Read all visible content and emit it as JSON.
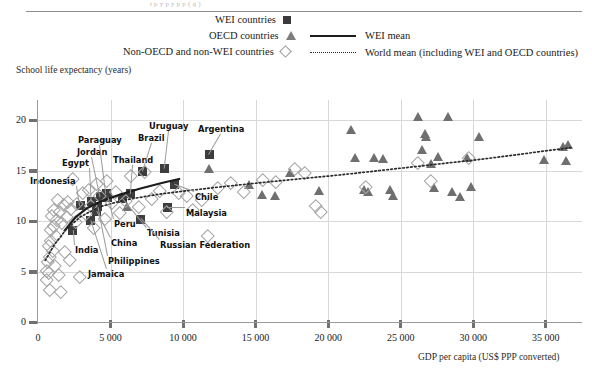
{
  "figure": {
    "clipped_title": "t p   y  p        y  p      p        ( q       )",
    "y_axis_title": "School life expectancy (years)",
    "x_axis_title": "GDP per capita (US$ PPP converted)"
  },
  "legend": {
    "items": [
      {
        "label": "WEI  countries",
        "marker": "filled-square",
        "color": "#3b3b3b"
      },
      {
        "label": "OECD countries",
        "marker": "filled-triangle",
        "color": "#7d7d7d"
      },
      {
        "label": "Non-OECD and  non-WEI countries",
        "marker": "open-diamond",
        "color": "#999999"
      }
    ],
    "lines": [
      {
        "label": "WEI mean",
        "style": "solid",
        "color": "#1d1d1d"
      },
      {
        "label": "World mean (including WEI and OECD countries)",
        "style": "dotted",
        "color": "#2a2a2a"
      }
    ]
  },
  "chart_data": {
    "type": "scatter",
    "title": "",
    "xlabel": "GDP per capita (US$ PPP converted)",
    "ylabel": "School life expectancy (years)",
    "xlim": [
      0,
      37500
    ],
    "ylim": [
      0,
      22
    ],
    "xticks": [
      0,
      5000,
      10000,
      15000,
      20000,
      25000,
      30000,
      35000
    ],
    "xticklabels": [
      "0",
      "5 000",
      "10 000",
      "15 000",
      "20 000",
      "25 000",
      "30 000",
      "35 000"
    ],
    "yticks": [
      0,
      5,
      10,
      15,
      20
    ],
    "yticklabels": [
      "0",
      "5",
      "10",
      "15",
      "20"
    ],
    "grid": true,
    "legend_position": "top",
    "series": [
      {
        "name": "WEI countries",
        "marker": "filled-square",
        "color": "#3d3d3d",
        "points": [
          {
            "label": "India",
            "x": 2400,
            "y": 9.1
          },
          {
            "label": "Jamaica",
            "x": 3600,
            "y": 10.1
          },
          {
            "label": "Indonesia",
            "x": 2900,
            "y": 11.5
          },
          {
            "label": "Egypt",
            "x": 3700,
            "y": 11.9
          },
          {
            "label": "China",
            "x": 4000,
            "y": 11.0
          },
          {
            "label": "Philippines",
            "x": 4100,
            "y": 11.4
          },
          {
            "label": "Jordan",
            "x": 4300,
            "y": 12.4
          },
          {
            "label": "Paraguay",
            "x": 4700,
            "y": 12.7
          },
          {
            "label": "Peru",
            "x": 4800,
            "y": 12.3
          },
          {
            "label": "Tunisia",
            "x": 5800,
            "y": 12.2
          },
          {
            "label": "Thailand",
            "x": 6400,
            "y": 12.7
          },
          {
            "label": "Russian Federation",
            "x": 7100,
            "y": 10.2
          },
          {
            "label": "Brazil",
            "x": 7200,
            "y": 14.9
          },
          {
            "label": "Uruguay",
            "x": 8700,
            "y": 15.2
          },
          {
            "label": "Malaysia",
            "x": 8900,
            "y": 11.3
          },
          {
            "label": "Chile",
            "x": 9400,
            "y": 13.6
          },
          {
            "label": "Argentina",
            "x": 11800,
            "y": 16.6
          }
        ]
      },
      {
        "name": "OECD countries",
        "marker": "filled-triangle",
        "color": "#6f6f6f",
        "points": [
          {
            "x": 6200,
            "y": 11.4
          },
          {
            "x": 11800,
            "y": 15.2
          },
          {
            "x": 14600,
            "y": 13.6
          },
          {
            "x": 15500,
            "y": 12.6
          },
          {
            "x": 16400,
            "y": 12.5
          },
          {
            "x": 17400,
            "y": 14.8
          },
          {
            "x": 19400,
            "y": 13.0
          },
          {
            "x": 21600,
            "y": 19.0
          },
          {
            "x": 21900,
            "y": 16.3
          },
          {
            "x": 22500,
            "y": 13.1
          },
          {
            "x": 22800,
            "y": 12.9
          },
          {
            "x": 23200,
            "y": 16.3
          },
          {
            "x": 23800,
            "y": 16.2
          },
          {
            "x": 24300,
            "y": 13.1
          },
          {
            "x": 24500,
            "y": 12.5
          },
          {
            "x": 26200,
            "y": 20.3
          },
          {
            "x": 26500,
            "y": 17.0
          },
          {
            "x": 26700,
            "y": 18.6
          },
          {
            "x": 26800,
            "y": 18.3
          },
          {
            "x": 27100,
            "y": 15.7
          },
          {
            "x": 27300,
            "y": 13.3
          },
          {
            "x": 27600,
            "y": 16.4
          },
          {
            "x": 28300,
            "y": 20.3
          },
          {
            "x": 28600,
            "y": 12.9
          },
          {
            "x": 29100,
            "y": 12.4
          },
          {
            "x": 29600,
            "y": 16.3
          },
          {
            "x": 29900,
            "y": 13.4
          },
          {
            "x": 30400,
            "y": 18.3
          },
          {
            "x": 34900,
            "y": 16.1
          },
          {
            "x": 36200,
            "y": 17.3
          },
          {
            "x": 36400,
            "y": 16.0
          },
          {
            "x": 36600,
            "y": 17.5
          }
        ]
      },
      {
        "name": "Non-OECD and non-WEI countries",
        "marker": "open-diamond",
        "color": "#a5a5a5",
        "points": [
          {
            "x": 500,
            "y": 5.2
          },
          {
            "x": 550,
            "y": 4.3
          },
          {
            "x": 600,
            "y": 6.1
          },
          {
            "x": 650,
            "y": 5.0
          },
          {
            "x": 700,
            "y": 7.7
          },
          {
            "x": 720,
            "y": 6.6
          },
          {
            "x": 760,
            "y": 3.3
          },
          {
            "x": 800,
            "y": 9.2
          },
          {
            "x": 820,
            "y": 8.2
          },
          {
            "x": 900,
            "y": 10.6
          },
          {
            "x": 950,
            "y": 7.2
          },
          {
            "x": 1000,
            "y": 9.6
          },
          {
            "x": 1050,
            "y": 11.2
          },
          {
            "x": 1100,
            "y": 5.7
          },
          {
            "x": 1150,
            "y": 8.6
          },
          {
            "x": 1250,
            "y": 10.2
          },
          {
            "x": 1300,
            "y": 12.2
          },
          {
            "x": 1350,
            "y": 4.8
          },
          {
            "x": 1400,
            "y": 11.0
          },
          {
            "x": 1500,
            "y": 3.1
          },
          {
            "x": 1600,
            "y": 9.9
          },
          {
            "x": 1700,
            "y": 11.7
          },
          {
            "x": 1800,
            "y": 7.1
          },
          {
            "x": 1900,
            "y": 10.5
          },
          {
            "x": 2000,
            "y": 12.0
          },
          {
            "x": 2100,
            "y": 6.3
          },
          {
            "x": 2200,
            "y": 11.3
          },
          {
            "x": 2300,
            "y": 14.3
          },
          {
            "x": 2500,
            "y": 10.0
          },
          {
            "x": 2600,
            "y": 11.8
          },
          {
            "x": 2800,
            "y": 4.6
          },
          {
            "x": 3000,
            "y": 12.9
          },
          {
            "x": 3200,
            "y": 10.8
          },
          {
            "x": 3400,
            "y": 13.2
          },
          {
            "x": 3600,
            "y": 11.6
          },
          {
            "x": 3800,
            "y": 9.4
          },
          {
            "x": 4000,
            "y": 13.8
          },
          {
            "x": 4200,
            "y": 12.6
          },
          {
            "x": 4500,
            "y": 10.3
          },
          {
            "x": 4700,
            "y": 14.1
          },
          {
            "x": 5000,
            "y": 11.9
          },
          {
            "x": 5300,
            "y": 13.0
          },
          {
            "x": 5600,
            "y": 10.9
          },
          {
            "x": 6000,
            "y": 12.1
          },
          {
            "x": 6300,
            "y": 14.6
          },
          {
            "x": 6900,
            "y": 11.5
          },
          {
            "x": 7300,
            "y": 15.0
          },
          {
            "x": 7800,
            "y": 12.3
          },
          {
            "x": 8300,
            "y": 13.1
          },
          {
            "x": 8800,
            "y": 11.0
          },
          {
            "x": 9600,
            "y": 12.9
          },
          {
            "x": 10200,
            "y": 12.6
          },
          {
            "x": 10600,
            "y": 11.2
          },
          {
            "x": 11200,
            "y": 12.2
          },
          {
            "x": 11600,
            "y": 8.6
          },
          {
            "x": 12300,
            "y": 13.4
          },
          {
            "x": 13200,
            "y": 13.9
          },
          {
            "x": 14100,
            "y": 13.0
          },
          {
            "x": 15400,
            "y": 14.2
          },
          {
            "x": 16300,
            "y": 14.0
          },
          {
            "x": 17600,
            "y": 15.3
          },
          {
            "x": 18300,
            "y": 14.9
          },
          {
            "x": 19100,
            "y": 11.6
          },
          {
            "x": 19400,
            "y": 11.0
          },
          {
            "x": 22500,
            "y": 13.5
          },
          {
            "x": 26100,
            "y": 15.9
          },
          {
            "x": 27000,
            "y": 14.1
          },
          {
            "x": 29600,
            "y": 16.4
          }
        ]
      }
    ],
    "trend_lines": [
      {
        "name": "WEI mean",
        "style": "solid",
        "color": "#1d1d1d",
        "points": [
          [
            1800,
            9.0
          ],
          [
            2600,
            10.4
          ],
          [
            3400,
            11.3
          ],
          [
            4400,
            12.0
          ],
          [
            5600,
            12.6
          ],
          [
            7000,
            13.2
          ],
          [
            8600,
            13.8
          ],
          [
            9800,
            14.2
          ]
        ]
      },
      {
        "name": "World mean (including WEI and OECD countries)",
        "style": "dotted",
        "color": "#2a2a2a",
        "points": [
          [
            500,
            6.1
          ],
          [
            1100,
            7.6
          ],
          [
            1900,
            9.1
          ],
          [
            2900,
            10.4
          ],
          [
            4200,
            11.4
          ],
          [
            6000,
            12.1
          ],
          [
            8500,
            12.7
          ],
          [
            12000,
            13.3
          ],
          [
            16000,
            13.9
          ],
          [
            21000,
            14.6
          ],
          [
            26000,
            15.4
          ],
          [
            31000,
            16.2
          ],
          [
            36800,
            17.3
          ]
        ]
      }
    ],
    "annotated_labels": [
      "Indonesia",
      "Egypt",
      "Jordan",
      "Paraguay",
      "Thailand",
      "Brazil",
      "Uruguay",
      "Argentina",
      "India",
      "Jamaica",
      "China",
      "Philippines",
      "Peru",
      "Tunisia",
      "Russian Federation",
      "Chile",
      "Malaysia"
    ]
  }
}
